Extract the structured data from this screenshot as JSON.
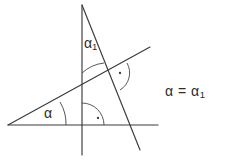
{
  "figure": {
    "kind": "geometry-diagram",
    "background_color": "#ffffff",
    "stroke_color": "#3a3a3a",
    "text_color": "#2b2b2b",
    "width": 240,
    "height": 162
  },
  "labels": {
    "angle_alpha1": "α",
    "angle_alpha1_sub": "1",
    "angle_alpha": "α",
    "equation_lhs": "α",
    "equation_op": "=",
    "equation_rhs": "α",
    "equation_rhs_sub": "1",
    "equation_full": "α = α1"
  },
  "lines": [
    {
      "name": "horizontal-baseline",
      "x1": 8,
      "y1": 125,
      "x2": 158,
      "y2": 125
    },
    {
      "name": "vertical-line",
      "x1": 82,
      "y1": 5,
      "x2": 82,
      "y2": 155
    },
    {
      "name": "rising-diagonal",
      "x1": 8,
      "y1": 125,
      "x2": 150,
      "y2": 47
    },
    {
      "name": "descending-diagonal",
      "x1": 82,
      "y1": 5,
      "x2": 140,
      "y2": 150
    }
  ],
  "arcs": [
    {
      "name": "arc-alpha1",
      "path": "M 82 73 A 39 39 0 0 1 104 63",
      "note": "angle between vertical line and descending diagonal"
    },
    {
      "name": "arc-alpha",
      "path": "M 66 125 A 42 42 0 0 0 60 102",
      "note": "angle between horizontal baseline and rising diagonal"
    }
  ],
  "right_angles": [
    {
      "name": "right-angle-origin",
      "arc_path": "M 104 125 A 22 22 0 0 0 82 103",
      "dot_x": 98,
      "dot_y": 118,
      "note": "perpendicular between horizontal baseline and vertical line"
    },
    {
      "name": "right-angle-intersection",
      "arc_path": "M 127 63 A 20 20 0 0 1 120 90",
      "dot_x": 120,
      "dot_y": 73,
      "note": "perpendicular between the two diagonals"
    }
  ]
}
